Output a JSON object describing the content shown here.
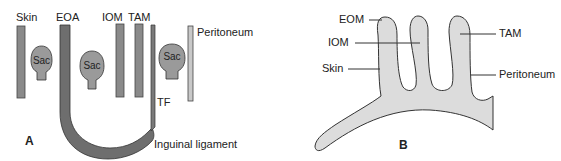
{
  "figure": {
    "panels": [
      {
        "id": "A",
        "letter": "A",
        "labels": {
          "skin": "Skin",
          "eoa": "EOA",
          "iom": "IOM",
          "tam": "TAM",
          "peritoneum": "Peritoneum",
          "tf": "TF",
          "inguinal_ligament": "Inguinal ligament"
        },
        "sacs": [
          "Sac",
          "Sac",
          "Sac"
        ]
      },
      {
        "id": "B",
        "letter": "B",
        "labels": {
          "eom": "EOM",
          "iom": "IOM",
          "skin": "Skin",
          "tam": "TAM",
          "peritoneum": "Peritoneum"
        }
      }
    ],
    "colors": {
      "layer_bar": "#8a8a8a",
      "eoa_band": "#6e6e6e",
      "sac_fill": "#9a9a9a",
      "peritoneum_bar": "#c8c8c8",
      "panel_b_fill": "#dcdcdc",
      "outline": "#333333"
    }
  }
}
